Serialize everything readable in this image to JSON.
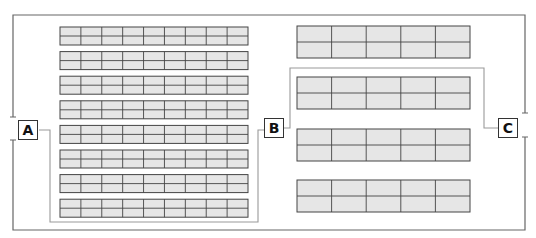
{
  "diagram": {
    "type": "classroom-seating-layout",
    "colors": {
      "frame": "#666666",
      "bracket": "#9a9a9a",
      "cell_fill": "#e6e6e6",
      "cell_border": "#444444",
      "label_border": "#333333"
    },
    "labels": [
      {
        "id": "A",
        "text": "A"
      },
      {
        "id": "B",
        "text": "B"
      },
      {
        "id": "C",
        "text": "C"
      }
    ],
    "groups": {
      "A": {
        "tables": 8,
        "columns": 9,
        "rows_per_table": 2
      },
      "B": {
        "tables": 2,
        "columns": 5,
        "rows_per_table": 2
      },
      "C": {
        "tables": 2,
        "columns": 5,
        "rows_per_table": 2
      }
    },
    "right_column": {
      "tables": 4,
      "columns": 5,
      "rows_per_table": 2
    }
  }
}
